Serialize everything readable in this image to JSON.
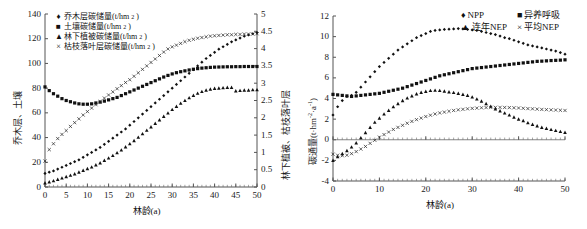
{
  "figure": {
    "panels": [
      {
        "id": "left",
        "legend": [
          {
            "marker": "diamond",
            "label": "乔木层碳储量(t/hm",
            "sup": "2",
            "tail": ")"
          },
          {
            "marker": "square",
            "label": "土壤碳储量(t/hm",
            "sup": "2",
            "tail": ")"
          },
          {
            "marker": "triangle",
            "label": "林下植被碳储量(t/hm",
            "sup": "2",
            "tail": ")"
          },
          {
            "marker": "cross",
            "label": "枯枝落叶层碳储量(t/hm",
            "sup": "2",
            "tail": ")"
          }
        ],
        "xlabel": "林龄(a)",
        "ylabel_left": "乔木层、土壤",
        "ylabel_right": "林下植被、枯枝落叶层"
      },
      {
        "id": "right",
        "legend": [
          {
            "marker": "diamond",
            "label": "NPP"
          },
          {
            "marker": "square",
            "label": "异养呼吸"
          },
          {
            "marker": "triangle",
            "label": "连年NEP"
          },
          {
            "marker": "cross",
            "label": "平均NEP"
          }
        ],
        "xlabel": "林龄(a)",
        "ylabel": "碳通量(t·hm",
        "ylabel_sup1": "-2",
        "ylabel_mid": "·a",
        "ylabel_sup2": "-1",
        "ylabel_tail": ")"
      }
    ]
  },
  "chart_data": [
    {
      "type": "scatter",
      "id": "carbon-storage-by-stand-age",
      "title": "",
      "xlabel": "林龄(a)",
      "ylabel": "乔木层、土壤",
      "ylabel_secondary": "林下植被、枯枝落叶层",
      "xlim": [
        0,
        50
      ],
      "ylim": [
        0,
        140
      ],
      "ylim_secondary": [
        0,
        5
      ],
      "xticks": [
        0,
        5,
        10,
        15,
        20,
        25,
        30,
        35,
        40,
        45,
        50
      ],
      "yticks": [
        0,
        20,
        40,
        60,
        80,
        100,
        120,
        140
      ],
      "yticks_secondary": [
        0,
        0.5,
        1,
        1.5,
        2,
        2.5,
        3,
        3.5,
        4,
        4.5,
        5
      ],
      "grid": false,
      "legend_position": "top-left",
      "x": [
        0,
        1,
        2,
        3,
        4,
        5,
        6,
        7,
        8,
        9,
        10,
        11,
        12,
        13,
        14,
        15,
        16,
        17,
        18,
        19,
        20,
        21,
        22,
        23,
        24,
        25,
        26,
        27,
        28,
        29,
        30,
        31,
        32,
        33,
        34,
        35,
        36,
        37,
        38,
        39,
        40,
        41,
        42,
        43,
        44,
        45,
        46,
        47,
        48,
        49,
        50
      ],
      "series": [
        {
          "name": "乔木层碳储量(t/hm2)",
          "axis": "left",
          "marker": "diamond",
          "values": [
            11,
            12,
            13,
            14.5,
            16,
            17.5,
            19,
            20.5,
            22,
            24,
            26,
            28,
            30,
            32,
            34.5,
            37,
            39.5,
            42,
            44.5,
            47,
            50,
            53,
            56,
            59,
            62,
            65,
            68,
            71,
            74,
            77,
            80,
            83,
            86,
            89,
            92,
            95,
            98,
            101,
            104,
            106.5,
            109,
            111.5,
            113.5,
            115.5,
            117.5,
            119,
            120.5,
            122,
            123,
            124,
            125
          ]
        },
        {
          "name": "土壤碳储量(t/hm2)",
          "axis": "left",
          "marker": "square",
          "values": [
            81,
            78,
            75.5,
            73.5,
            71.5,
            70,
            69,
            68,
            67.3,
            67,
            67,
            67.3,
            68,
            68.7,
            69.5,
            70.5,
            71.5,
            72.5,
            74,
            75.5,
            77,
            78.5,
            80,
            81.5,
            83,
            84.5,
            86,
            87.5,
            89,
            90.3,
            91.5,
            92.5,
            93.3,
            94,
            94.7,
            95.3,
            95.8,
            96.2,
            96.5,
            96.8,
            97,
            97.1,
            97.2,
            97.3,
            97.3,
            97.4,
            97.4,
            97.5,
            97.5,
            97.5,
            97.5
          ]
        },
        {
          "name": "林下植被碳储量(t/hm2)",
          "axis": "right",
          "marker": "triangle",
          "values": [
            0.12,
            0.15,
            0.18,
            0.22,
            0.26,
            0.3,
            0.34,
            0.38,
            0.43,
            0.48,
            0.53,
            0.58,
            0.64,
            0.7,
            0.77,
            0.84,
            0.91,
            0.99,
            1.07,
            1.16,
            1.25,
            1.34,
            1.44,
            1.54,
            1.64,
            1.74,
            1.84,
            1.94,
            2.04,
            2.14,
            2.24,
            2.33,
            2.42,
            2.5,
            2.58,
            2.65,
            2.71,
            2.76,
            2.8,
            2.83,
            2.85,
            2.86,
            2.87,
            2.88,
            2.88,
            2.78,
            2.79,
            2.8,
            2.8,
            2.81,
            2.81
          ]
        },
        {
          "name": "枯枝落叶层碳储量(t/hm2)",
          "axis": "right",
          "marker": "cross",
          "values": [
            0.75,
            1.08,
            1.25,
            1.4,
            1.52,
            1.63,
            1.75,
            1.86,
            1.97,
            2.08,
            2.18,
            2.28,
            2.38,
            2.47,
            2.57,
            2.66,
            2.75,
            2.84,
            2.93,
            3.02,
            3.1,
            3.2,
            3.3,
            3.4,
            3.5,
            3.6,
            3.7,
            3.8,
            3.9,
            3.99,
            4.05,
            4.1,
            4.15,
            4.2,
            4.24,
            4.27,
            4.3,
            4.32,
            4.34,
            4.36,
            4.37,
            4.38,
            4.39,
            4.4,
            4.4,
            4.41,
            4.41,
            4.42,
            4.42,
            4.42,
            4.43
          ]
        }
      ]
    },
    {
      "type": "scatter",
      "id": "carbon-flux-by-stand-age",
      "title": "",
      "xlabel": "林龄(a)",
      "ylabel": "碳通量(t·hm-2·a-1)",
      "xlim": [
        0,
        50
      ],
      "ylim": [
        -4,
        12
      ],
      "xticks": [
        0,
        10,
        20,
        30,
        40,
        50
      ],
      "yticks": [
        -4,
        -2,
        0,
        2,
        4,
        6,
        8,
        10,
        12
      ],
      "grid": false,
      "legend_position": "top-right",
      "x": [
        0,
        1,
        2,
        3,
        4,
        5,
        6,
        7,
        8,
        9,
        10,
        11,
        12,
        13,
        14,
        15,
        16,
        17,
        18,
        19,
        20,
        21,
        22,
        23,
        24,
        25,
        26,
        27,
        28,
        29,
        30,
        31,
        32,
        33,
        34,
        35,
        36,
        37,
        38,
        39,
        40,
        41,
        42,
        43,
        44,
        45,
        46,
        47,
        48,
        49,
        50
      ],
      "series": [
        {
          "name": "NPP",
          "marker": "diamond",
          "values": [
            2.4,
            3.2,
            3.8,
            4.2,
            4.3,
            4.6,
            5.1,
            5.6,
            6.1,
            6.6,
            7.1,
            7.5,
            7.9,
            8.3,
            8.7,
            9.0,
            9.3,
            9.6,
            9.9,
            10.1,
            10.3,
            10.5,
            10.6,
            10.65,
            10.7,
            10.72,
            10.75,
            10.78,
            10.75,
            10.7,
            10.65,
            10.6,
            10.5,
            10.4,
            10.3,
            10.2,
            10.05,
            9.9,
            9.8,
            9.65,
            9.5,
            9.35,
            9.2,
            9.1,
            9.0,
            8.9,
            8.8,
            8.7,
            8.6,
            8.45,
            8.3
          ]
        },
        {
          "name": "异养呼吸",
          "marker": "square",
          "values": [
            4.4,
            4.35,
            4.3,
            4.25,
            4.2,
            4.25,
            4.3,
            4.35,
            4.4,
            4.45,
            4.5,
            4.6,
            4.7,
            4.8,
            4.9,
            5.0,
            5.15,
            5.3,
            5.45,
            5.6,
            5.75,
            5.9,
            6.05,
            6.2,
            6.3,
            6.4,
            6.5,
            6.6,
            6.7,
            6.8,
            6.9,
            6.95,
            7.0,
            7.05,
            7.1,
            7.15,
            7.2,
            7.25,
            7.3,
            7.35,
            7.4,
            7.45,
            7.5,
            7.55,
            7.6,
            7.62,
            7.65,
            7.68,
            7.7,
            7.72,
            7.75
          ]
        },
        {
          "name": "连年NEP",
          "marker": "triangle",
          "values": [
            -2.0,
            -1.65,
            -1.35,
            -1.05,
            -0.7,
            -0.3,
            0.2,
            0.7,
            1.2,
            1.7,
            2.1,
            2.5,
            2.85,
            3.2,
            3.5,
            3.8,
            4.05,
            4.25,
            4.45,
            4.6,
            4.7,
            4.78,
            4.8,
            4.78,
            4.72,
            4.65,
            4.58,
            4.5,
            4.4,
            4.3,
            4.15,
            3.95,
            3.75,
            3.5,
            3.25,
            3.0,
            2.8,
            2.6,
            2.4,
            2.2,
            2.0,
            1.85,
            1.65,
            1.5,
            1.35,
            1.2,
            1.1,
            1.0,
            0.9,
            0.8,
            0.72
          ]
        },
        {
          "name": "平均NEP",
          "marker": "cross",
          "values": [
            -1.4,
            -1.5,
            -1.55,
            -1.5,
            -1.35,
            -1.15,
            -0.9,
            -0.65,
            -0.35,
            -0.05,
            0.25,
            0.5,
            0.75,
            1.0,
            1.2,
            1.4,
            1.6,
            1.78,
            1.95,
            2.1,
            2.25,
            2.38,
            2.5,
            2.6,
            2.68,
            2.76,
            2.84,
            2.9,
            2.95,
            3.0,
            3.04,
            3.07,
            3.1,
            3.12,
            3.13,
            3.14,
            3.14,
            3.13,
            3.12,
            3.1,
            3.08,
            3.05,
            3.02,
            3.0,
            2.97,
            2.94,
            2.92,
            2.9,
            2.88,
            2.86,
            2.84
          ]
        }
      ]
    }
  ]
}
